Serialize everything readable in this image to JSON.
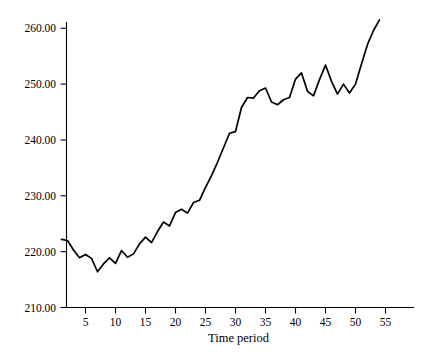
{
  "chart_data": {
    "type": "line",
    "title": "",
    "subtitle": "",
    "xlabel": "Time period",
    "ylabel": "",
    "xlim": [
      1,
      60
    ],
    "ylim": [
      210,
      262
    ],
    "grid": false,
    "legend": "none",
    "x_ticks": [
      5,
      10,
      15,
      20,
      25,
      30,
      35,
      40,
      45,
      50,
      55
    ],
    "x_tick_labels": [
      "5",
      "10",
      "15",
      "20",
      "25",
      "30",
      "35",
      "40",
      "45",
      "50",
      "55"
    ],
    "y_ticks": [
      210,
      220,
      230,
      240,
      250,
      260
    ],
    "y_tick_labels": [
      "210.00",
      "220.00",
      "230.00",
      "240.00",
      "250.00",
      "260.00"
    ],
    "line_color": "#000000",
    "series": [
      {
        "name": "Time period series",
        "x": [
          1,
          2,
          3,
          4,
          5,
          6,
          7,
          8,
          9,
          10,
          11,
          12,
          13,
          14,
          15,
          16,
          17,
          18,
          19,
          20,
          21,
          22,
          23,
          24,
          25,
          26,
          27,
          28,
          29,
          30,
          31,
          32,
          33,
          34,
          35,
          36,
          37,
          38,
          39,
          40,
          41,
          42,
          43,
          44,
          45,
          46,
          47,
          48,
          49,
          50,
          51,
          52,
          53,
          54
        ],
        "values": [
          222.2,
          222.0,
          220.3,
          218.9,
          219.5,
          218.8,
          216.4,
          217.8,
          218.9,
          217.9,
          220.2,
          219.0,
          219.6,
          221.4,
          222.6,
          221.6,
          223.6,
          225.3,
          224.6,
          227.0,
          227.6,
          226.9,
          228.8,
          229.2,
          231.5,
          233.6,
          236.0,
          238.6,
          241.2,
          241.5,
          245.8,
          247.6,
          247.5,
          248.8,
          249.3,
          246.8,
          246.3,
          247.2,
          247.6,
          250.9,
          252.0,
          248.7,
          247.9,
          250.8,
          253.4,
          250.5,
          248.2,
          250.0,
          248.4,
          250.0,
          253.6,
          257.1,
          259.6,
          261.5
        ]
      }
    ]
  },
  "axes": {
    "x_axis_title": "Time period"
  }
}
